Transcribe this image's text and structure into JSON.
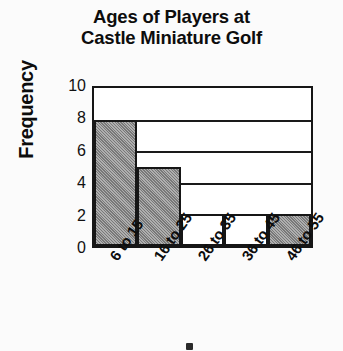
{
  "chart_data": {
    "type": "bar",
    "title": "Ages of Players at Castle Miniature Golf",
    "title_lines": [
      "Ages of Players at",
      "Castle Miniature Golf"
    ],
    "xlabel": "",
    "ylabel": "Frequency",
    "categories": [
      "6 to 15",
      "16 to 25",
      "26 to 35",
      "36 to 45",
      "46 to 55"
    ],
    "values": [
      8,
      5,
      2,
      2,
      2
    ],
    "bar_styles": [
      "filled",
      "filled",
      "open",
      "open",
      "filled"
    ],
    "ylim": [
      0,
      10
    ],
    "yticks": [
      10,
      8,
      6,
      4,
      2,
      0
    ],
    "gridlines": [
      8,
      6,
      4,
      2
    ],
    "grid": true,
    "legend": null,
    "colors": {
      "bar_fill": "#8c8c8c",
      "bar_open": "#ffffff",
      "bar_edge": "#161616",
      "grid": "#1a1a1a",
      "axis": "#161616",
      "text": "#0d0d0d",
      "background": "#fbfbfb"
    }
  }
}
